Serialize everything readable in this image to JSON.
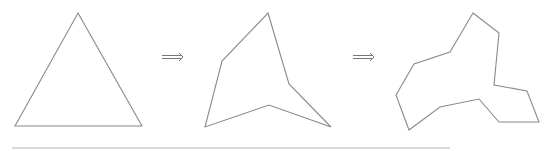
{
  "diagram": {
    "stroke_color": "#8a8a8a",
    "shapes": [
      {
        "name": "triangle",
        "vertices": 3,
        "points": "78,13 142,126 15,126"
      },
      {
        "name": "hexagon-star",
        "vertices": 6,
        "points": "268,13 289,84 331,127 269,105 205,127 222,61"
      },
      {
        "name": "dodecagon-star",
        "vertices": 12,
        "points": "473,13 499,33 494,85 527,91 539,122 499,122 479,99 440,107 409,130 396,95 414,64 450,52"
      }
    ],
    "arrows": [
      {
        "symbol": "⟹",
        "x1": 162,
        "x2": 183,
        "y": 57
      },
      {
        "symbol": "⟹",
        "x1": 353,
        "x2": 374,
        "y": 57
      }
    ],
    "baseline": {
      "x1": 12,
      "x2": 450,
      "y": 148
    }
  }
}
